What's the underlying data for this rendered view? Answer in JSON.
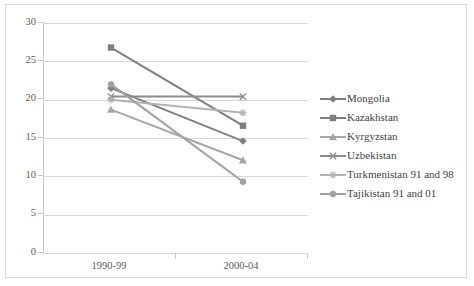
{
  "chart_data": {
    "type": "line",
    "title": "",
    "xlabel": "",
    "ylabel": "",
    "categories": [
      "1990-99",
      "2000-04"
    ],
    "ylim": [
      0,
      30
    ],
    "yticks": [
      0,
      5,
      10,
      15,
      20,
      25,
      30
    ],
    "ytick_labels": [
      "0",
      "5",
      "10",
      "15",
      "20",
      "25",
      "30"
    ],
    "grid": true,
    "legend_position": "right",
    "series": [
      {
        "name": "Mongolia",
        "values": [
          21.5,
          14.6
        ],
        "marker": "diamond",
        "color": "#808080"
      },
      {
        "name": "Kazakhstan",
        "values": [
          26.8,
          16.6
        ],
        "marker": "square",
        "color": "#7f7f7f"
      },
      {
        "name": "Kyrgyzstan",
        "values": [
          18.7,
          12.1
        ],
        "marker": "triangle",
        "color": "#a6a6a6"
      },
      {
        "name": "Uzbekistan",
        "values": [
          20.4,
          20.4
        ],
        "marker": "x",
        "color": "#8c8c8c"
      },
      {
        "name": "Turkmenistan 91 and 98",
        "values": [
          20.0,
          18.3
        ],
        "marker": "asterisk",
        "color": "#b3b3b3"
      },
      {
        "name": "Tajikistan 91 and 01",
        "values": [
          22.0,
          9.3
        ],
        "marker": "circle",
        "color": "#a0a0a0"
      }
    ]
  },
  "legend": {
    "items": [
      {
        "label": "Mongolia"
      },
      {
        "label": "Kazakhstan"
      },
      {
        "label": "Kyrgyzstan"
      },
      {
        "label": "Uzbekistan"
      },
      {
        "label": "Turkmenistan 91 and 98"
      },
      {
        "label": "Tajikistan 91 and 01"
      }
    ]
  },
  "axes": {
    "y_labels": [
      "30",
      "25",
      "20",
      "15",
      "10",
      "5",
      "0"
    ],
    "x_labels": [
      "1990-99",
      "2000-04"
    ]
  },
  "colors": {
    "gridline": "#d9d9d9",
    "axis": "#c8c8c8",
    "text": "#595959",
    "border": "#d9d9d9"
  }
}
